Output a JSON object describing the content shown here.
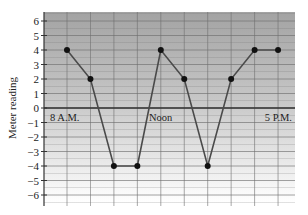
{
  "chart_data": {
    "type": "line",
    "title": "",
    "xlabel": "",
    "ylabel": "Meter reading",
    "ylim": [
      -6,
      6
    ],
    "yticks": [
      6,
      5,
      4,
      3,
      2,
      1,
      0,
      -1,
      -2,
      -3,
      -4,
      -5,
      -6
    ],
    "ytick_labels": [
      "6",
      "5",
      "4",
      "3",
      "2",
      "1",
      "0",
      "−1",
      "−2",
      "−3",
      "−4",
      "−5",
      "−6"
    ],
    "x": [
      "8 A.M.",
      "9 A.M.",
      "10 A.M.",
      "11 A.M.",
      "Noon",
      "1 P.M.",
      "2 P.M.",
      "3 P.M.",
      "4 P.M.",
      "5 P.M."
    ],
    "x_labels_shown": {
      "0": "8 A.M.",
      "4": "Noon",
      "9": "5 P.M."
    },
    "series": [
      {
        "name": "Meter reading",
        "values": [
          4,
          2,
          -4,
          -4,
          4,
          2,
          -4,
          2,
          4,
          4
        ]
      }
    ],
    "grid": true,
    "legend": "none",
    "background": "gray gradient, dark at top fading to white at bottom"
  },
  "labels": {
    "ylabel": "Meter reading",
    "x_start": "8 A.M.",
    "x_noon": "Noon",
    "x_end": "5 P.M."
  },
  "colors": {
    "bg_top": "#a3a3a3",
    "bg_bottom": "#ffffff",
    "grid": "#6f6f6f",
    "line": "#4a4a4a",
    "marker": "#111111",
    "axis": "#333333"
  }
}
